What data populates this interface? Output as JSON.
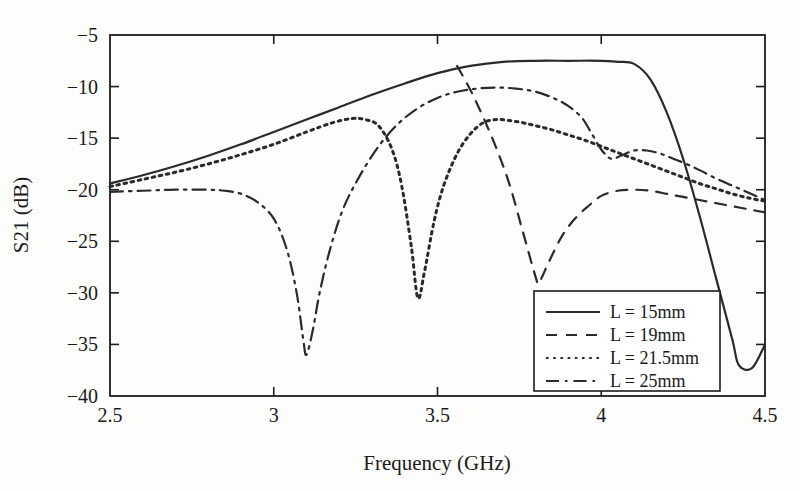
{
  "chart_data": {
    "type": "line",
    "title": "",
    "xlabel": "Frequency (GHz)",
    "ylabel": "S21 (dB)",
    "xlim": [
      2.5,
      4.5
    ],
    "ylim": [
      -40,
      -5
    ],
    "xticks": [
      "2.5",
      "3",
      "3.5",
      "4",
      "4.5"
    ],
    "xtick_values": [
      2.5,
      3,
      3.5,
      4,
      4.5
    ],
    "yticks": [
      "-5",
      "-10",
      "-15",
      "-20",
      "-25",
      "-30",
      "-35",
      "-40"
    ],
    "ytick_values": [
      -5,
      -10,
      -15,
      -20,
      -25,
      -30,
      -35,
      -40
    ],
    "grid": false,
    "legend_position": "lower right",
    "series": [
      {
        "name": "L = 15mm",
        "style": "solid",
        "x": [
          2.5,
          2.6,
          2.7,
          2.8,
          2.9,
          3.0,
          3.1,
          3.2,
          3.3,
          3.4,
          3.5,
          3.6,
          3.7,
          3.8,
          3.9,
          4.0,
          4.05,
          4.1,
          4.15,
          4.2,
          4.25,
          4.3,
          4.35,
          4.4,
          4.42,
          4.46,
          4.5
        ],
        "y": [
          -19.4,
          -18.6,
          -17.7,
          -16.7,
          -15.6,
          -14.4,
          -13.2,
          -12.0,
          -10.8,
          -9.7,
          -8.7,
          -8.0,
          -7.6,
          -7.5,
          -7.5,
          -7.5,
          -7.6,
          -7.8,
          -9.3,
          -12.5,
          -17.0,
          -22.5,
          -28.5,
          -34.5,
          -37.0,
          -37.3,
          -35.0
        ]
      },
      {
        "name": "L = 19mm",
        "style": "dashed",
        "x": [
          3.56,
          3.6,
          3.64,
          3.68,
          3.72,
          3.76,
          3.8,
          3.81,
          3.84,
          3.88,
          3.92,
          3.96,
          4.0,
          4.05,
          4.1,
          4.15,
          4.2,
          4.25,
          4.3,
          4.35,
          4.4,
          4.45,
          4.5
        ],
        "y": [
          -8.0,
          -10.3,
          -13.0,
          -16.0,
          -19.5,
          -24.0,
          -28.5,
          -29.0,
          -27.0,
          -24.5,
          -22.8,
          -21.6,
          -20.6,
          -20.1,
          -20.0,
          -20.1,
          -20.4,
          -20.7,
          -21.0,
          -21.3,
          -21.6,
          -21.9,
          -22.2
        ]
      },
      {
        "name": "L = 21.5mm",
        "style": "dotted",
        "x": [
          2.5,
          2.6,
          2.7,
          2.8,
          2.9,
          3.0,
          3.1,
          3.18,
          3.24,
          3.28,
          3.32,
          3.36,
          3.39,
          3.42,
          3.44,
          3.46,
          3.49,
          3.52,
          3.56,
          3.6,
          3.64,
          3.68,
          3.72,
          3.76,
          3.8,
          3.85,
          3.9,
          3.95,
          4.0,
          4.05,
          4.1,
          4.15,
          4.2,
          4.25,
          4.3,
          4.35,
          4.4,
          4.45,
          4.5
        ],
        "y": [
          -19.7,
          -19.0,
          -18.3,
          -17.5,
          -16.6,
          -15.6,
          -14.4,
          -13.5,
          -13.1,
          -13.2,
          -13.8,
          -16.0,
          -19.5,
          -25.5,
          -30.5,
          -28.0,
          -23.0,
          -19.5,
          -16.5,
          -14.6,
          -13.5,
          -13.2,
          -13.3,
          -13.5,
          -13.8,
          -14.2,
          -14.7,
          -15.2,
          -15.8,
          -16.4,
          -17.0,
          -17.6,
          -18.2,
          -18.8,
          -19.4,
          -19.9,
          -20.4,
          -20.8,
          -21.1
        ]
      },
      {
        "name": "L = 25mm",
        "style": "dashdot",
        "x": [
          2.5,
          2.6,
          2.7,
          2.8,
          2.85,
          2.9,
          2.95,
          3.0,
          3.04,
          3.07,
          3.09,
          3.1,
          3.12,
          3.14,
          3.17,
          3.21,
          3.26,
          3.32,
          3.38,
          3.44,
          3.5,
          3.56,
          3.62,
          3.68,
          3.74,
          3.8,
          3.86,
          3.9,
          3.94,
          3.97,
          4.0,
          4.03,
          4.06,
          4.1,
          4.14,
          4.18,
          4.22,
          4.26,
          4.3,
          4.35,
          4.4,
          4.45,
          4.5
        ],
        "y": [
          -20.2,
          -20.1,
          -20.0,
          -20.0,
          -20.1,
          -20.4,
          -21.2,
          -22.8,
          -25.8,
          -30.0,
          -34.5,
          -36.0,
          -33.5,
          -30.0,
          -26.0,
          -22.0,
          -18.8,
          -15.8,
          -13.6,
          -12.1,
          -11.1,
          -10.5,
          -10.2,
          -10.1,
          -10.2,
          -10.5,
          -11.2,
          -11.9,
          -13.0,
          -14.5,
          -16.1,
          -17.0,
          -16.7,
          -16.2,
          -16.2,
          -16.5,
          -17.0,
          -17.5,
          -18.1,
          -18.9,
          -19.6,
          -20.3,
          -21.0
        ]
      }
    ],
    "annotations": {
      "notch_minima": [
        {
          "series": "L = 25mm",
          "frequency_ghz": 3.1,
          "s21_db": -36.0
        },
        {
          "series": "L = 21.5mm",
          "frequency_ghz": 3.44,
          "s21_db": -30.5
        },
        {
          "series": "L = 19mm",
          "frequency_ghz": 3.81,
          "s21_db": -29.0
        },
        {
          "series": "L = 15mm",
          "frequency_ghz": 4.44,
          "s21_db": -37.3
        }
      ]
    }
  },
  "legend": {
    "entries": [
      {
        "label": "L = 15mm",
        "style": "solid"
      },
      {
        "label": "L = 19mm",
        "style": "dashed"
      },
      {
        "label": "L = 21.5mm",
        "style": "dotted"
      },
      {
        "label": "L = 25mm",
        "style": "dashdot"
      }
    ]
  },
  "colors": {
    "line": "#2a2a2a",
    "axis": "#1c1c1c",
    "background": "#fdfdfc",
    "text": "#1a1a1a"
  }
}
